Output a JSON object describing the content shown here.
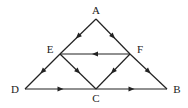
{
  "diagram": {
    "type": "directed-graph",
    "nodes": [
      {
        "id": "A",
        "label": "A",
        "x": 96,
        "y": 19,
        "lx": 96,
        "ly": 14
      },
      {
        "id": "E",
        "label": "E",
        "x": 60,
        "y": 54,
        "lx": 50,
        "ly": 53
      },
      {
        "id": "F",
        "label": "F",
        "x": 130,
        "y": 54,
        "lx": 140,
        "ly": 53
      },
      {
        "id": "D",
        "label": "D",
        "x": 25,
        "y": 89,
        "lx": 15,
        "ly": 93
      },
      {
        "id": "C",
        "label": "C",
        "x": 96,
        "y": 89,
        "lx": 96,
        "ly": 102
      },
      {
        "id": "B",
        "label": "B",
        "x": 167,
        "y": 89,
        "lx": 177,
        "ly": 93
      }
    ],
    "edges": [
      {
        "from": "A",
        "to": "E"
      },
      {
        "from": "A",
        "to": "F"
      },
      {
        "from": "F",
        "to": "E"
      },
      {
        "from": "E",
        "to": "D"
      },
      {
        "from": "E",
        "to": "C"
      },
      {
        "from": "F",
        "to": "C"
      },
      {
        "from": "F",
        "to": "B"
      },
      {
        "from": "D",
        "to": "C"
      },
      {
        "from": "C",
        "to": "B"
      }
    ]
  }
}
